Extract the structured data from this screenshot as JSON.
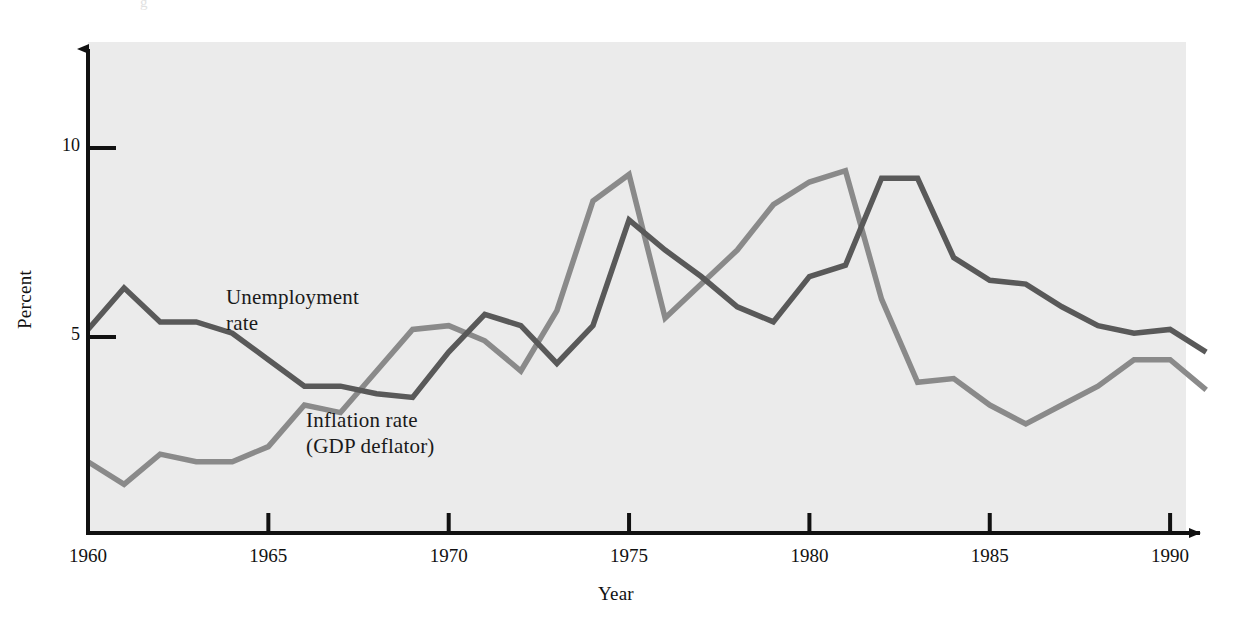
{
  "figure": {
    "background_color": "#ffffff",
    "plot_background_color": "#ebebeb",
    "axis_color": "#111111",
    "partial_header_glyph": "g"
  },
  "labels": {
    "ylabel": "Percent",
    "xlabel": "Year",
    "unemployment_annotation": "Unemployment\nrate",
    "inflation_annotation": "Inflation rate\n(GDP deflator)"
  },
  "axes": {
    "x_ticks": [
      "1960",
      "1965",
      "1970",
      "1975",
      "1980",
      "1985",
      "1990"
    ],
    "y_ticks": [
      "5",
      "10"
    ],
    "x_range": [
      1960,
      1991
    ],
    "y_range": [
      0,
      11.5
    ],
    "x_arrow": true,
    "y_arrow": true
  },
  "chart_data": {
    "type": "line",
    "title": "",
    "subtitle": "",
    "xlabel": "Year",
    "ylabel": "Percent",
    "xlim": [
      1960,
      1991
    ],
    "ylim": [
      0,
      11.5
    ],
    "grid": false,
    "legend_position": "inline-annotation",
    "x": [
      1960,
      1961,
      1962,
      1963,
      1964,
      1965,
      1966,
      1967,
      1968,
      1969,
      1970,
      1971,
      1972,
      1973,
      1974,
      1975,
      1976,
      1977,
      1978,
      1979,
      1980,
      1981,
      1982,
      1983,
      1984,
      1985,
      1986,
      1987,
      1988,
      1989,
      1990,
      1991
    ],
    "series": [
      {
        "name": "Unemployment rate",
        "color": "#595959",
        "values": [
          5.2,
          6.3,
          5.4,
          5.4,
          5.1,
          4.4,
          3.7,
          3.7,
          3.5,
          3.4,
          4.6,
          5.6,
          5.3,
          4.3,
          5.3,
          8.1,
          7.3,
          6.6,
          5.8,
          5.4,
          6.6,
          6.9,
          9.2,
          9.2,
          7.1,
          6.5,
          6.4,
          5.8,
          5.3,
          5.1,
          5.2,
          4.6
        ]
      },
      {
        "name": "Inflation rate (GDP deflator)",
        "color": "#8a8a8a",
        "values": [
          1.7,
          1.1,
          1.9,
          1.7,
          1.7,
          2.1,
          3.2,
          3.0,
          4.1,
          5.2,
          5.3,
          4.9,
          4.1,
          5.7,
          8.6,
          9.3,
          5.5,
          6.4,
          7.3,
          8.5,
          9.1,
          9.4,
          6.0,
          3.8,
          3.9,
          3.2,
          2.7,
          3.2,
          3.7,
          4.4,
          4.4,
          3.6
        ]
      }
    ]
  }
}
